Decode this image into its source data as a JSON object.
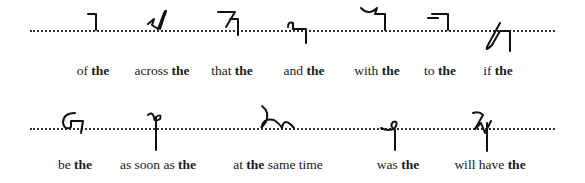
{
  "rows": [
    {
      "items": [
        {
          "pre": "of ",
          "bold": "the",
          "post": ""
        },
        {
          "pre": "across ",
          "bold": "the",
          "post": ""
        },
        {
          "pre": "that ",
          "bold": "the",
          "post": ""
        },
        {
          "pre": "and ",
          "bold": "the",
          "post": ""
        },
        {
          "pre": "with ",
          "bold": "the",
          "post": ""
        },
        {
          "pre": "to ",
          "bold": "the",
          "post": ""
        },
        {
          "pre": "if ",
          "bold": "the",
          "post": ""
        }
      ]
    },
    {
      "items": [
        {
          "pre": "be ",
          "bold": "the",
          "post": ""
        },
        {
          "pre": "as soon as ",
          "bold": "the",
          "post": ""
        },
        {
          "pre": "at ",
          "bold": "the",
          "post": " same time"
        },
        {
          "pre": "was ",
          "bold": "the",
          "post": ""
        },
        {
          "pre": "will have ",
          "bold": "the",
          "post": ""
        }
      ]
    }
  ]
}
